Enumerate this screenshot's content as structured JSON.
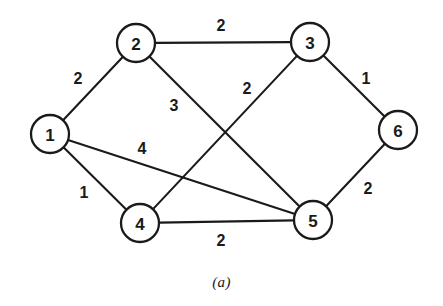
{
  "figure": {
    "caption": "(a)",
    "caption_x": 0,
    "caption_y": 274,
    "width": 443,
    "height": 306,
    "background_color": "#ffffff",
    "stroke_color": "#1a1a1a"
  },
  "chart_data": {
    "type": "diagram",
    "diagram_kind": "undirected-weighted-graph",
    "title": "(a)",
    "node_radius": 19,
    "nodes": [
      {
        "id": "1",
        "label": "1",
        "x": 50,
        "y": 134
      },
      {
        "id": "2",
        "label": "2",
        "x": 136,
        "y": 43
      },
      {
        "id": "3",
        "label": "3",
        "x": 310,
        "y": 42
      },
      {
        "id": "4",
        "label": "4",
        "x": 140,
        "y": 223
      },
      {
        "id": "5",
        "label": "5",
        "x": 313,
        "y": 220
      },
      {
        "id": "6",
        "label": "6",
        "x": 398,
        "y": 130
      }
    ],
    "edges": [
      {
        "source": "1",
        "target": "2",
        "weight": "2",
        "label_x": 78,
        "label_y": 78
      },
      {
        "source": "2",
        "target": "3",
        "weight": "2",
        "label_x": 221,
        "label_y": 25
      },
      {
        "source": "2",
        "target": "5",
        "weight": "3",
        "label_x": 174,
        "label_y": 105
      },
      {
        "source": "3",
        "target": "4",
        "weight": "2",
        "label_x": 247,
        "label_y": 88
      },
      {
        "source": "3",
        "target": "6",
        "weight": "1",
        "label_x": 366,
        "label_y": 78
      },
      {
        "source": "1",
        "target": "5",
        "weight": "4",
        "label_x": 142,
        "label_y": 148
      },
      {
        "source": "1",
        "target": "4",
        "weight": "1",
        "label_x": 84,
        "label_y": 192
      },
      {
        "source": "4",
        "target": "5",
        "weight": "2",
        "label_x": 221,
        "label_y": 240
      },
      {
        "source": "5",
        "target": "6",
        "weight": "2",
        "label_x": 368,
        "label_y": 188
      }
    ],
    "xlabel": "",
    "ylabel": "",
    "grid": false,
    "legend": "none"
  }
}
